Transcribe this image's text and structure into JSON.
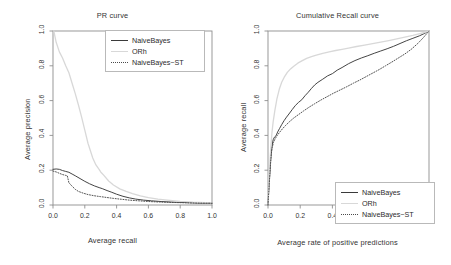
{
  "figure": {
    "width": 451,
    "height": 265,
    "background": "#ffffff",
    "series_colors": {
      "NaiveBayes": "#3a3a3a",
      "ORh": "#d8d8d8",
      "NaiveBayes-ST": "#4a4a4a"
    }
  },
  "chart_data": [
    {
      "type": "line",
      "id": "pr-curve",
      "title": "PR curve",
      "xlabel": "Average recall",
      "ylabel": "Average precision",
      "xlim": [
        0.0,
        1.0
      ],
      "ylim": [
        0.0,
        1.0
      ],
      "xticks": [
        "0.0",
        "0.2",
        "0.4",
        "0.6",
        "0.8",
        "1.0"
      ],
      "yticks": [
        "0.0",
        "0.2",
        "0.4",
        "0.6",
        "0.8",
        "1.0"
      ],
      "xtick_values": [
        0.0,
        0.2,
        0.4,
        0.6,
        0.8,
        1.0
      ],
      "ytick_values": [
        0.0,
        0.2,
        0.4,
        0.6,
        0.8,
        1.0
      ],
      "grid": false,
      "legend_position": "top-right",
      "legend_entries": [
        "NaiveBayes",
        "ORh",
        "NaiveBayes-ST"
      ],
      "series": [
        {
          "name": "NaiveBayes",
          "style": "solid",
          "color": "#3a3a3a",
          "x": [
            0.0,
            0.02,
            0.04,
            0.06,
            0.08,
            0.1,
            0.12,
            0.14,
            0.17,
            0.2,
            0.23,
            0.26,
            0.29,
            0.31,
            0.34,
            0.37,
            0.4,
            0.44,
            0.48,
            0.52,
            0.57,
            0.62,
            0.68,
            0.74,
            0.8,
            0.86,
            0.92,
            1.0
          ],
          "y": [
            0.205,
            0.207,
            0.205,
            0.198,
            0.193,
            0.188,
            0.178,
            0.168,
            0.152,
            0.136,
            0.122,
            0.11,
            0.1,
            0.094,
            0.083,
            0.073,
            0.062,
            0.05,
            0.041,
            0.034,
            0.028,
            0.024,
            0.02,
            0.017,
            0.015,
            0.013,
            0.011,
            0.01
          ]
        },
        {
          "name": "ORh",
          "style": "solid",
          "color": "#d8d8d8",
          "x": [
            0.005,
            0.02,
            0.04,
            0.06,
            0.08,
            0.1,
            0.12,
            0.14,
            0.16,
            0.18,
            0.2,
            0.22,
            0.25,
            0.27,
            0.29,
            0.3,
            0.32,
            0.35,
            0.38,
            0.42,
            0.46,
            0.5,
            0.55,
            0.6,
            0.66,
            0.72,
            0.8,
            0.88,
            1.0
          ],
          "y": [
            1.0,
            0.935,
            0.88,
            0.845,
            0.8,
            0.76,
            0.7,
            0.64,
            0.575,
            0.505,
            0.43,
            0.355,
            0.27,
            0.23,
            0.205,
            0.19,
            0.17,
            0.138,
            0.115,
            0.093,
            0.078,
            0.065,
            0.053,
            0.043,
            0.034,
            0.028,
            0.021,
            0.016,
            0.012
          ]
        },
        {
          "name": "NaiveBayes-ST",
          "style": "dotted",
          "color": "#4a4a4a",
          "x": [
            0.0,
            0.02,
            0.04,
            0.06,
            0.08,
            0.09,
            0.1,
            0.12,
            0.14,
            0.16,
            0.19,
            0.22,
            0.26,
            0.3,
            0.34,
            0.38,
            0.43,
            0.48,
            0.54,
            0.6,
            0.67,
            0.74,
            0.82,
            0.9,
            1.0
          ],
          "y": [
            0.195,
            0.19,
            0.182,
            0.175,
            0.17,
            0.168,
            0.128,
            0.108,
            0.09,
            0.078,
            0.068,
            0.06,
            0.053,
            0.048,
            0.043,
            0.038,
            0.033,
            0.028,
            0.024,
            0.02,
            0.017,
            0.015,
            0.013,
            0.011,
            0.01
          ]
        }
      ]
    },
    {
      "type": "line",
      "id": "cumulative-recall-curve",
      "title": "Cumulative Recall curve",
      "xlabel": "Average rate of positive predictions",
      "ylabel": "Average recall",
      "xlim": [
        0.0,
        1.0
      ],
      "ylim": [
        0.0,
        1.0
      ],
      "xticks": [
        "0.0",
        "0.2",
        "0.4",
        "0.6",
        "0.8",
        "1.0"
      ],
      "yticks": [
        "0.0",
        "0.2",
        "0.4",
        "0.6",
        "0.8",
        "1.0"
      ],
      "xtick_values": [
        0.0,
        0.2,
        0.4,
        0.6,
        0.8,
        1.0
      ],
      "ytick_values": [
        0.0,
        0.2,
        0.4,
        0.6,
        0.8,
        1.0
      ],
      "grid": false,
      "legend_position": "bottom-right",
      "legend_entries": [
        "NaiveBayes",
        "ORh",
        "NaiveBayes-ST"
      ],
      "series": [
        {
          "name": "NaiveBayes",
          "style": "solid",
          "color": "#3a3a3a",
          "x": [
            0.0,
            0.004,
            0.008,
            0.012,
            0.016,
            0.02,
            0.026,
            0.032,
            0.04,
            0.05,
            0.06,
            0.072,
            0.085,
            0.1,
            0.115,
            0.13,
            0.15,
            0.17,
            0.19,
            0.21,
            0.23,
            0.25,
            0.27,
            0.29,
            0.31,
            0.34,
            0.37,
            0.4,
            0.43,
            0.46,
            0.5,
            0.54,
            0.58,
            0.62,
            0.66,
            0.7,
            0.74,
            0.78,
            0.82,
            0.86,
            0.9,
            0.94,
            0.97,
            1.0
          ],
          "y": [
            0.0,
            0.07,
            0.13,
            0.19,
            0.25,
            0.3,
            0.345,
            0.375,
            0.39,
            0.398,
            0.42,
            0.44,
            0.462,
            0.485,
            0.505,
            0.523,
            0.548,
            0.572,
            0.59,
            0.605,
            0.628,
            0.648,
            0.67,
            0.69,
            0.705,
            0.723,
            0.742,
            0.755,
            0.775,
            0.79,
            0.812,
            0.83,
            0.845,
            0.858,
            0.872,
            0.885,
            0.898,
            0.912,
            0.928,
            0.944,
            0.958,
            0.972,
            0.985,
            1.0
          ]
        },
        {
          "name": "ORh",
          "style": "solid",
          "color": "#d8d8d8",
          "x": [
            0.0,
            0.004,
            0.008,
            0.012,
            0.018,
            0.024,
            0.032,
            0.042,
            0.055,
            0.07,
            0.085,
            0.1,
            0.12,
            0.14,
            0.16,
            0.185,
            0.21,
            0.24,
            0.27,
            0.3,
            0.34,
            0.38,
            0.42,
            0.46,
            0.5,
            0.55,
            0.6,
            0.65,
            0.7,
            0.75,
            0.8,
            0.85,
            0.9,
            0.95,
            1.0
          ],
          "y": [
            0.0,
            0.09,
            0.175,
            0.25,
            0.335,
            0.41,
            0.478,
            0.54,
            0.608,
            0.665,
            0.705,
            0.733,
            0.762,
            0.782,
            0.798,
            0.815,
            0.828,
            0.843,
            0.853,
            0.862,
            0.872,
            0.88,
            0.888,
            0.895,
            0.902,
            0.911,
            0.919,
            0.927,
            0.936,
            0.945,
            0.955,
            0.965,
            0.975,
            0.987,
            1.0
          ]
        },
        {
          "name": "NaiveBayes-ST",
          "style": "dotted",
          "color": "#4a4a4a",
          "x": [
            0.0,
            0.004,
            0.008,
            0.012,
            0.016,
            0.02,
            0.026,
            0.034,
            0.045,
            0.058,
            0.072,
            0.09,
            0.11,
            0.135,
            0.16,
            0.19,
            0.22,
            0.255,
            0.29,
            0.33,
            0.37,
            0.41,
            0.45,
            0.49,
            0.53,
            0.57,
            0.61,
            0.65,
            0.69,
            0.73,
            0.77,
            0.81,
            0.85,
            0.89,
            0.93,
            0.965,
            1.0
          ],
          "y": [
            0.0,
            0.065,
            0.125,
            0.185,
            0.24,
            0.29,
            0.33,
            0.36,
            0.382,
            0.4,
            0.418,
            0.438,
            0.458,
            0.48,
            0.5,
            0.52,
            0.54,
            0.562,
            0.582,
            0.604,
            0.624,
            0.644,
            0.662,
            0.68,
            0.7,
            0.718,
            0.738,
            0.758,
            0.778,
            0.8,
            0.822,
            0.845,
            0.868,
            0.895,
            0.928,
            0.962,
            1.0
          ]
        }
      ]
    }
  ]
}
